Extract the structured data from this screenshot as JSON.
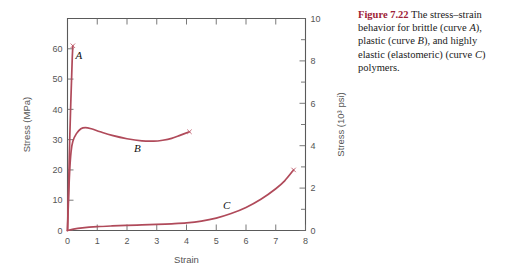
{
  "caption": {
    "label": "Figure 7.22",
    "text_parts": [
      "   The stress–strain behavior for brittle (curve ",
      "A",
      "), plastic (curve ",
      "B",
      "), and highly elastic (elastomeric) (curve ",
      "C",
      ") polymers."
    ],
    "full_text": "Figure 7.22   The stress–strain behavior for brittle (curve A), plastic (curve B), and highly elastic (elastomeric) (curve C) polymers.",
    "label_color": "#9e2236"
  },
  "chart_data": {
    "type": "line",
    "title": "",
    "xlabel": "Strain",
    "ylabel": "Stress (MPa)",
    "ylabel_right": "Stress (10³ psi)",
    "xlim": [
      0,
      8
    ],
    "ylim": [
      0,
      70
    ],
    "ylim_right": [
      0,
      10
    ],
    "xticks": [
      0,
      1,
      2,
      3,
      4,
      5,
      6,
      7,
      8
    ],
    "xticklabels": [
      "0",
      "1",
      "2",
      "3",
      "4",
      "5",
      "6",
      "7",
      "8"
    ],
    "yticks": [
      0,
      10,
      20,
      30,
      40,
      50,
      60
    ],
    "yticklabels": [
      "0",
      "10",
      "20",
      "30",
      "40",
      "50",
      "60"
    ],
    "yticks_right": [
      0,
      1,
      2,
      3,
      4,
      5,
      6,
      7,
      8,
      9,
      10
    ],
    "yticklabels_right": [
      "0",
      "",
      "2",
      "",
      "4",
      "",
      "6",
      "",
      "8",
      "",
      "10"
    ],
    "grid": false,
    "legend": "none",
    "curve_color": "#b04a5a",
    "series": [
      {
        "name": "A",
        "label": "A",
        "label_x": 0.38,
        "label_y": 56.5,
        "description": "brittle polymer",
        "failure_point": {
          "x": 0.18,
          "y": 61.0
        },
        "points": [
          [
            0.0,
            0.0
          ],
          [
            0.02,
            8.0
          ],
          [
            0.05,
            20.0
          ],
          [
            0.08,
            32.0
          ],
          [
            0.11,
            42.0
          ],
          [
            0.14,
            51.0
          ],
          [
            0.16,
            57.0
          ],
          [
            0.18,
            61.0
          ]
        ]
      },
      {
        "name": "B",
        "label": "B",
        "label_x": 2.35,
        "label_y": 26.0,
        "description": "plastic polymer",
        "failure_point": {
          "x": 4.1,
          "y": 32.6
        },
        "points": [
          [
            0.0,
            0.0
          ],
          [
            0.03,
            9.0
          ],
          [
            0.07,
            19.0
          ],
          [
            0.12,
            26.0
          ],
          [
            0.18,
            29.5
          ],
          [
            0.3,
            32.0
          ],
          [
            0.45,
            33.6
          ],
          [
            0.6,
            34.0
          ],
          [
            0.8,
            33.6
          ],
          [
            1.1,
            32.6
          ],
          [
            1.5,
            31.4
          ],
          [
            2.0,
            30.3
          ],
          [
            2.5,
            29.6
          ],
          [
            2.9,
            29.5
          ],
          [
            3.2,
            29.8
          ],
          [
            3.5,
            30.4
          ],
          [
            3.8,
            31.5
          ],
          [
            4.1,
            32.6
          ]
        ]
      },
      {
        "name": "C",
        "label": "C",
        "label_x": 5.35,
        "label_y": 7.0,
        "description": "highly elastic (elastomeric) polymer",
        "failure_point": {
          "x": 7.6,
          "y": 20.0
        },
        "points": [
          [
            0.0,
            0.0
          ],
          [
            0.2,
            0.45
          ],
          [
            0.5,
            0.85
          ],
          [
            1.0,
            1.25
          ],
          [
            1.5,
            1.5
          ],
          [
            2.0,
            1.7
          ],
          [
            2.5,
            1.85
          ],
          [
            3.0,
            2.0
          ],
          [
            3.5,
            2.2
          ],
          [
            4.0,
            2.5
          ],
          [
            4.5,
            3.1
          ],
          [
            5.0,
            4.1
          ],
          [
            5.5,
            5.6
          ],
          [
            6.0,
            7.6
          ],
          [
            6.5,
            10.3
          ],
          [
            7.0,
            13.8
          ],
          [
            7.3,
            16.4
          ],
          [
            7.6,
            20.0
          ]
        ]
      }
    ]
  }
}
